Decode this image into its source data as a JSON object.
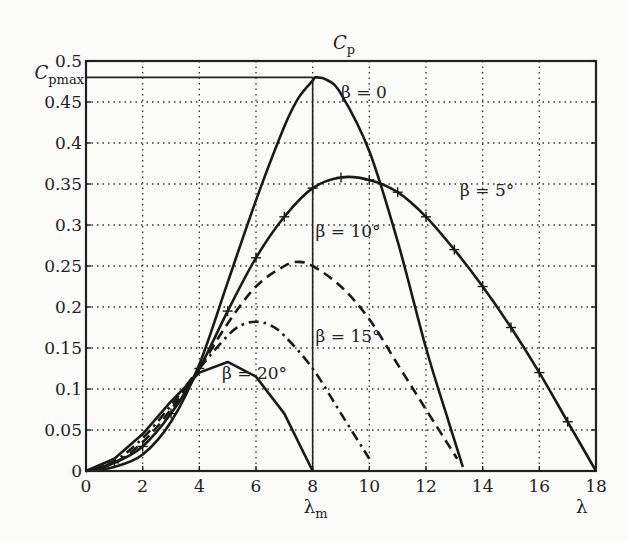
{
  "chart_data": {
    "type": "line",
    "title_main": "C",
    "title_sub": "p",
    "xlabel": "λ",
    "ylabel": "",
    "xlim": [
      0,
      18
    ],
    "ylim": [
      0,
      0.5
    ],
    "grid": true,
    "x_ticks": [
      0,
      2,
      4,
      6,
      8,
      10,
      12,
      14,
      16,
      18
    ],
    "x_tick_labels": [
      "0",
      "2",
      "4",
      "6",
      "8",
      "10",
      "12",
      "14",
      "16",
      "18"
    ],
    "y_ticks": [
      0,
      0.05,
      0.1,
      0.15,
      0.2,
      0.25,
      0.3,
      0.35,
      0.4,
      0.45,
      0.5
    ],
    "y_tick_labels": [
      "0",
      "0.05",
      "0.1",
      "0.15",
      "0.2",
      "0.25",
      "0.3",
      "0.35",
      "0.4",
      "0.45",
      "0.5"
    ],
    "annotations": {
      "cpmax": {
        "label_main": "C",
        "label_sub": "pmax",
        "value": 0.48
      },
      "lambda_m": {
        "label_main": "λ",
        "label_sub": "m",
        "value": 8
      }
    },
    "series": [
      {
        "name": "β = 0",
        "style": "solid",
        "markers": false,
        "x": [
          0,
          1,
          2,
          3,
          4,
          5,
          6,
          7,
          7.5,
          8,
          8.1,
          8.5,
          9,
          10,
          11,
          12,
          12.8,
          13.3
        ],
        "y": [
          0,
          0.005,
          0.02,
          0.06,
          0.13,
          0.23,
          0.33,
          0.42,
          0.455,
          0.476,
          0.48,
          0.477,
          0.46,
          0.39,
          0.28,
          0.15,
          0.06,
          0.005
        ]
      },
      {
        "name": "β = 5°",
        "style": "solid",
        "markers": true,
        "x": [
          0,
          1,
          2,
          3,
          4,
          5,
          6,
          7,
          8,
          9,
          10,
          11,
          12,
          13,
          14,
          15,
          16,
          17,
          18
        ],
        "y": [
          0,
          0.01,
          0.03,
          0.07,
          0.125,
          0.195,
          0.26,
          0.31,
          0.345,
          0.358,
          0.355,
          0.34,
          0.31,
          0.27,
          0.225,
          0.175,
          0.12,
          0.06,
          0.0
        ]
      },
      {
        "name": "β = 10°",
        "style": "dashed",
        "markers": false,
        "x": [
          0,
          1,
          2,
          3,
          4,
          5,
          6,
          7,
          7.5,
          8,
          9,
          10,
          11,
          12,
          13.1
        ],
        "y": [
          0,
          0.01,
          0.035,
          0.075,
          0.125,
          0.18,
          0.225,
          0.25,
          0.255,
          0.25,
          0.225,
          0.185,
          0.13,
          0.075,
          0.015
        ]
      },
      {
        "name": "β = 15°",
        "style": "dashdot",
        "markers": false,
        "x": [
          0,
          1,
          2,
          3,
          4,
          5,
          5.5,
          6,
          6.5,
          7,
          8,
          9,
          10
        ],
        "y": [
          0,
          0.012,
          0.04,
          0.08,
          0.125,
          0.165,
          0.178,
          0.182,
          0.178,
          0.165,
          0.125,
          0.07,
          0.015
        ]
      },
      {
        "name": "β = 20°",
        "style": "solid",
        "markers": false,
        "x": [
          0,
          1,
          2,
          3,
          4,
          5,
          6,
          7,
          8
        ],
        "y": [
          0,
          0.015,
          0.045,
          0.085,
          0.12,
          0.133,
          0.115,
          0.07,
          0.0
        ]
      }
    ],
    "curve_labels": [
      {
        "text": "β = 0",
        "x": 9.0,
        "y": 0.455
      },
      {
        "text": "β = 5°",
        "x": 13.2,
        "y": 0.335
      },
      {
        "text": "β = 10°",
        "x": 8.1,
        "y": 0.285
      },
      {
        "text": "β = 15°",
        "x": 8.1,
        "y": 0.157
      },
      {
        "text": "β = 20°",
        "x": 4.8,
        "y": 0.112
      }
    ]
  }
}
